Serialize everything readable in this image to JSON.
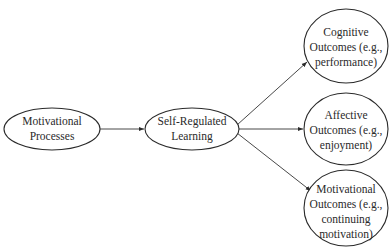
{
  "diagram": {
    "type": "flow",
    "colors": {
      "stroke": "#2a2a2a",
      "text": "#2a2a2a",
      "background": "#ffffff"
    },
    "nodes": [
      {
        "id": "motivational-processes",
        "lines": [
          "Motivational",
          "Processes"
        ]
      },
      {
        "id": "self-regulated-learning",
        "lines": [
          "Self-Regulated",
          "Learning"
        ]
      },
      {
        "id": "cognitive-outcomes",
        "lines": [
          "Cognitive",
          "Outcomes (e.g.,",
          "performance)"
        ]
      },
      {
        "id": "affective-outcomes",
        "lines": [
          "Affective",
          "Outcomes (e.g.,",
          "enjoyment)"
        ]
      },
      {
        "id": "motivational-outcomes",
        "lines": [
          "Motivational",
          "Outcomes (e.g.,",
          "continuing",
          "motivation)"
        ]
      }
    ],
    "edges": [
      {
        "from": "motivational-processes",
        "to": "self-regulated-learning"
      },
      {
        "from": "self-regulated-learning",
        "to": "cognitive-outcomes"
      },
      {
        "from": "self-regulated-learning",
        "to": "affective-outcomes"
      },
      {
        "from": "self-regulated-learning",
        "to": "motivational-outcomes"
      }
    ]
  }
}
